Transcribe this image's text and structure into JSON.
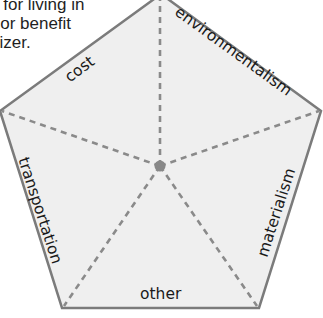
{
  "intro_text": {
    "lines": [
      "s for living in",
      "n or benefit",
      "nizer."
    ]
  },
  "diagram": {
    "type": "pentagon-graphic-organizer",
    "colors": {
      "fill": "#efefef",
      "outline": "#7b7b7b",
      "dash": "#8a8a8a",
      "center_dot": "#888888",
      "text": "#1a1a1a"
    },
    "sections": [
      {
        "id": "cost",
        "label": "cost"
      },
      {
        "id": "environmentalism",
        "label": "environmentalism"
      },
      {
        "id": "materialism",
        "label": "materialism"
      },
      {
        "id": "other",
        "label": "other"
      },
      {
        "id": "transportation",
        "label": "transportation"
      }
    ]
  }
}
